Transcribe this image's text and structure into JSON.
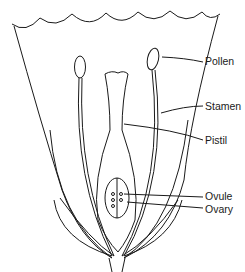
{
  "diagram": {
    "labels": [
      {
        "id": "pollen",
        "text": "Pollen"
      },
      {
        "id": "stamen",
        "text": "Stamen"
      },
      {
        "id": "pistil",
        "text": "Pistil"
      },
      {
        "id": "ovule",
        "text": "Ovule"
      },
      {
        "id": "ovary",
        "text": "Ovary"
      }
    ]
  }
}
